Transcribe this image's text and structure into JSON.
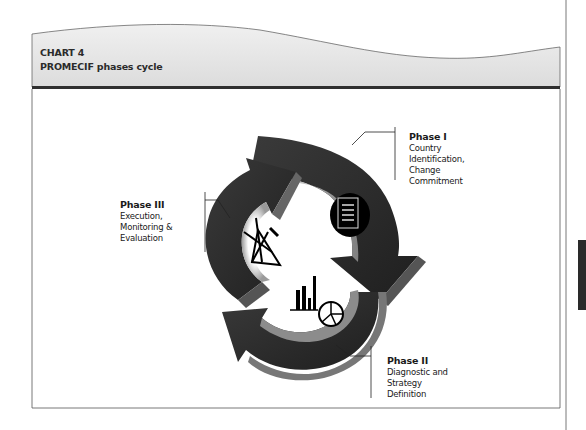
{
  "header": {
    "chart_label": "CHART 4",
    "title": "PROMECIF phases cycle"
  },
  "phases": [
    {
      "title": "Phase I",
      "description_lines": [
        "Country",
        "Identification,",
        "Change",
        "Commitment"
      ],
      "icon": "document-icon"
    },
    {
      "title": "Phase II",
      "description_lines": [
        "Diagnostic and",
        "Strategy",
        "Definition"
      ],
      "icon": "bar-pie-chart-icon"
    },
    {
      "title": "Phase III",
      "description_lines": [
        "Execution,",
        "Monitoring &",
        "Evaluation"
      ],
      "icon": "tools-icon"
    }
  ],
  "colors": {
    "header_band": "#e6e6e6",
    "header_rule": "#333333",
    "arrow_dark": "#2e2e2e",
    "arrow_mid": "#5a5a5a",
    "arrow_light": "#bdbdbd",
    "frame_line": "#555555"
  }
}
